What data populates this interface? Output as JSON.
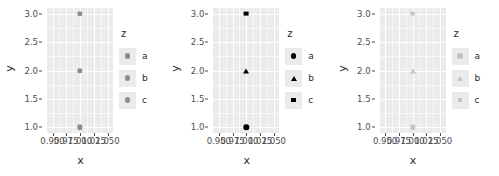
{
  "figure": {
    "panel_bg": "#ebebeb",
    "grid_color": "#ffffff",
    "text_color": "#2b2b2b",
    "tick_color": "#4d4d4d"
  },
  "axes": {
    "xlabel": "x",
    "ylabel": "y",
    "y_ticks": [
      "1.0",
      "1.5",
      "2.0",
      "2.5",
      "3.0"
    ],
    "y_values": [
      1.0,
      1.5,
      2.0,
      2.5,
      3.0
    ],
    "ylim": [
      0.9,
      3.1
    ],
    "x_ticks": [
      "0.950",
      "0.975",
      "1.000",
      "1.025",
      "1.050"
    ],
    "x_values": [
      0.95,
      0.975,
      1.0,
      1.025,
      1.05
    ],
    "xlim": [
      0.94,
      1.06
    ]
  },
  "legend": {
    "title": "z",
    "labels": [
      "a",
      "b",
      "c"
    ]
  },
  "chart_data": {
    "type": "scatter",
    "title": "",
    "xlabel": "x",
    "ylabel": "y",
    "xlim": [
      0.94,
      1.06
    ],
    "ylim": [
      0.9,
      3.1
    ],
    "grid": true,
    "legend_position": "right",
    "legend_title": "z",
    "x_tick_labels": [
      "0.950",
      "0.975",
      "1.000",
      "1.025",
      "1.050"
    ],
    "y_tick_labels": [
      "1.0",
      "1.5",
      "2.0",
      "2.5",
      "3.0"
    ],
    "panels": [
      {
        "name": "panel-colour-only",
        "marker_scale": "shape-constant-colour-constant",
        "series": [
          {
            "name": "a",
            "x": [
              1.0
            ],
            "y": [
              1.0
            ],
            "shape": "circle",
            "color": "#8c8c8c"
          },
          {
            "name": "b",
            "x": [
              1.0
            ],
            "y": [
              2.0
            ],
            "shape": "circle",
            "color": "#8c8c8c"
          },
          {
            "name": "c",
            "x": [
              1.0
            ],
            "y": [
              3.0
            ],
            "shape": "circle",
            "color": "#8c8c8c"
          }
        ]
      },
      {
        "name": "panel-shape-black",
        "marker_scale": "shape-varying-colour-black",
        "series": [
          {
            "name": "a",
            "x": [
              1.0
            ],
            "y": [
              1.0
            ],
            "shape": "circle",
            "color": "#000000"
          },
          {
            "name": "b",
            "x": [
              1.0
            ],
            "y": [
              2.0
            ],
            "shape": "triangle",
            "color": "#000000"
          },
          {
            "name": "c",
            "x": [
              1.0
            ],
            "y": [
              3.0
            ],
            "shape": "square",
            "color": "#000000"
          }
        ]
      },
      {
        "name": "panel-shape-grey",
        "marker_scale": "shape-varying-colour-light-grey",
        "series": [
          {
            "name": "a",
            "x": [
              1.0
            ],
            "y": [
              1.0
            ],
            "shape": "circle",
            "color": "#c4c4c4"
          },
          {
            "name": "b",
            "x": [
              1.0
            ],
            "y": [
              2.0
            ],
            "shape": "triangle",
            "color": "#c4c4c4"
          },
          {
            "name": "c",
            "x": [
              1.0
            ],
            "y": [
              3.0
            ],
            "shape": "square",
            "color": "#c4c4c4"
          }
        ]
      }
    ]
  }
}
